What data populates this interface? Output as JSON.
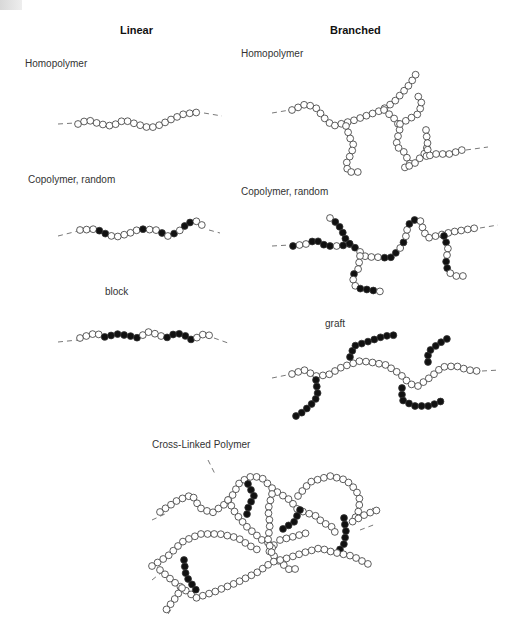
{
  "headers": {
    "linear": "Linear",
    "branched": "Branched"
  },
  "panels": {
    "linear_homopolymer": {
      "label": "Homopolymer",
      "type": "linear",
      "composition": "homopolymer"
    },
    "linear_random": {
      "label": "Copolymer, random",
      "type": "linear",
      "composition": "random copolymer"
    },
    "linear_block": {
      "label": "block",
      "type": "linear",
      "composition": "block copolymer"
    },
    "branched_homopolymer": {
      "label": "Homopolymer",
      "type": "branched",
      "composition": "homopolymer"
    },
    "branched_random": {
      "label": "Copolymer, random",
      "type": "branched",
      "composition": "random copolymer"
    },
    "branched_graft": {
      "label": "graft",
      "type": "branched",
      "composition": "graft copolymer"
    },
    "crosslinked": {
      "label": "Cross-Linked Polymer",
      "type": "cross-linked",
      "composition": "network"
    }
  },
  "legend": {
    "monomer_a": "open-circle",
    "monomer_b": "filled-circle"
  },
  "colors": {
    "monomer_a_fill": "#ffffff",
    "monomer_b_fill": "#111111",
    "stroke": "#333333"
  }
}
